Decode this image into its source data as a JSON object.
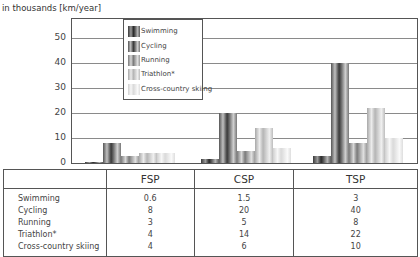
{
  "chart_data": {
    "type": "bar",
    "title": "",
    "ylabel": "in thousands [km/year]",
    "xlabel": "",
    "ylim": [
      0,
      55
    ],
    "yticks": [
      0,
      10,
      20,
      30,
      40,
      50
    ],
    "grid": true,
    "legend_position": "inside-top-left-center",
    "categories": [
      "FSP",
      "CSP",
      "TSP"
    ],
    "series": [
      {
        "name": "Swimming",
        "values": [
          0.6,
          1.5,
          3
        ]
      },
      {
        "name": "Cycling",
        "values": [
          8,
          20,
          40
        ]
      },
      {
        "name": "Running",
        "values": [
          3,
          5,
          8
        ]
      },
      {
        "name": "Triathlon*",
        "values": [
          4,
          14,
          22
        ]
      },
      {
        "name": "Cross-country skiing",
        "values": [
          4,
          6,
          10
        ]
      }
    ]
  },
  "axis": {
    "unit_label": "in thousands [km/year]",
    "ticks": [
      "0",
      "10",
      "20",
      "30",
      "40",
      "50"
    ]
  },
  "legend": {
    "items": [
      "Swimming",
      "Cycling",
      "Running",
      "Triathlon*",
      "Cross-country skiing"
    ]
  },
  "table": {
    "headers": [
      "",
      "FSP",
      "CSP",
      "TSP"
    ],
    "rows": [
      {
        "label": "Swimming",
        "fsp": "0.6",
        "csp": "1.5",
        "tsp": "3"
      },
      {
        "label": "Cycling",
        "fsp": "8",
        "csp": "20",
        "tsp": "40"
      },
      {
        "label": "Running",
        "fsp": "3",
        "csp": "5",
        "tsp": "8"
      },
      {
        "label": "Triathlon*",
        "fsp": "4",
        "csp": "14",
        "tsp": "22"
      },
      {
        "label": "Cross-country skiing",
        "fsp": "4",
        "csp": "6",
        "tsp": "10"
      }
    ]
  }
}
